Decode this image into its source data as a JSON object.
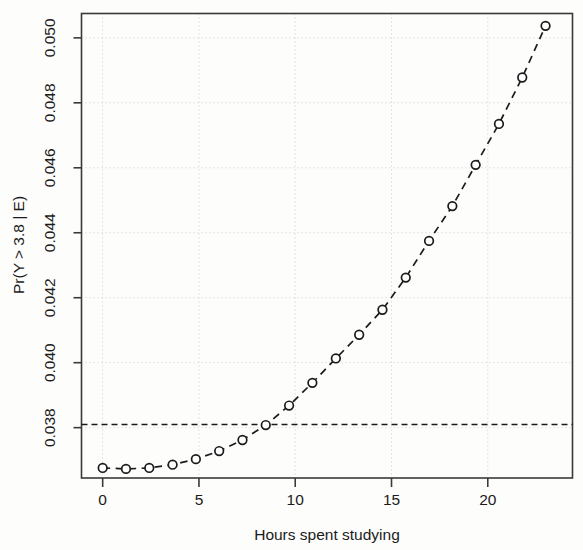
{
  "chart_data": {
    "type": "line",
    "title": "",
    "subtitle": "",
    "xlabel": "Hours spent studying",
    "ylabel": "Pr(Y > 3.8 | E)",
    "xlim": [
      -1.1,
      24.4
    ],
    "ylim": [
      0.03645,
      0.05075
    ],
    "xticks": [
      0,
      5,
      10,
      15,
      20
    ],
    "xtick_labels": [
      "0",
      "5",
      "10",
      "15",
      "20"
    ],
    "yticks": [
      0.038,
      0.04,
      0.042,
      0.044,
      0.046,
      0.048,
      0.05
    ],
    "ytick_labels": [
      "0.038",
      "0.040",
      "0.042",
      "0.044",
      "0.046",
      "0.048",
      "0.050"
    ],
    "grid": true,
    "grid_style": "dotted",
    "grid_color": "#cccccc",
    "legend": false,
    "legend_position": "none",
    "marker": "open-circle",
    "line_style": "dashed",
    "line_color": "#1b1b1b",
    "frame": true,
    "x": [
      0.0,
      1.21,
      2.42,
      3.63,
      4.84,
      6.05,
      7.26,
      8.47,
      9.68,
      10.89,
      12.11,
      13.32,
      14.53,
      15.74,
      16.95,
      18.16,
      19.37,
      20.58,
      21.79,
      23.0
    ],
    "values": [
      0.03676,
      0.03673,
      0.03676,
      0.03686,
      0.03703,
      0.03728,
      0.03762,
      0.03808,
      0.03868,
      0.03938,
      0.04013,
      0.04086,
      0.04163,
      0.04262,
      0.04375,
      0.04482,
      0.04609,
      0.04735,
      0.04878,
      0.05037
    ],
    "reference_lines": [
      {
        "name": "prior-probability-line",
        "orientation": "horizontal",
        "value": 0.0381,
        "style": "dashed",
        "color": "#1b1b1b"
      }
    ]
  }
}
